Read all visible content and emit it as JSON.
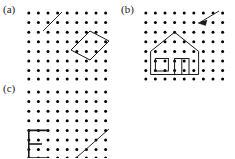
{
  "figure": {
    "background_color": "#ffffff",
    "ink_color": "#1a1a1a",
    "dot_color": "#000000",
    "panel_count": 3
  },
  "panels": [
    {
      "id": "a",
      "label": "(a)",
      "grid": {
        "cols": 9,
        "rows": 8,
        "spacing": 9.6,
        "dot_radius": 1.5
      },
      "shapes": [
        {
          "name": "diagonal-segment",
          "type": "line",
          "points": "39,3 20,22",
          "description": "short diagonal stroke in upper left area"
        },
        {
          "name": "rotated-rectangle",
          "type": "polygon",
          "points": "48,40 67,21 86,31 67,50",
          "description": "tilted rectangle outline right of center"
        }
      ]
    },
    {
      "id": "b",
      "label": "(b)",
      "grid": {
        "cols": 9,
        "rows": 8,
        "spacing": 9.6,
        "dot_radius": 1.5
      },
      "shapes": [
        {
          "name": "house-outline",
          "type": "polygon",
          "points": "9.6,38.4 9.6,67.2 57.6,67.2 57.6,38.4 33.6,19.2",
          "description": "house body with pitched roof"
        },
        {
          "name": "house-window",
          "type": "rect",
          "points": "14.4,48 28.8,48 28.8,62.4 14.4,62.4",
          "description": "small square window on the left of the house"
        },
        {
          "name": "house-door",
          "type": "rect",
          "points": "33.6,48 48,48 48,67.2 33.6,67.2",
          "description": "door rectangle right of the window"
        },
        {
          "name": "door-mullion",
          "type": "line",
          "points": "40.8,48 40.8,67.2",
          "description": "vertical divider inside the door"
        },
        {
          "name": "arrow-cursor",
          "type": "arrow",
          "points": "76.8,0 57.6,14.4",
          "description": "arrow pointing down-left in the upper right"
        }
      ]
    },
    {
      "id": "c",
      "label": "(c)",
      "grid": {
        "cols": 9,
        "rows": 8,
        "spacing": 9.6,
        "dot_radius": 1.5
      },
      "shapes": [
        {
          "name": "bracket-e-shape",
          "type": "polyline",
          "points": "24,38.4 4.8,38.4 4.8,67.2 24,67.2",
          "description": "open bracket forming an E-like figure"
        },
        {
          "name": "bracket-middle-bar",
          "type": "line",
          "points": "4.8,52.8 19.2,52.8",
          "description": "middle horizontal bar of the E"
        },
        {
          "name": "diagonal-segment",
          "type": "line",
          "points": "52.8,67.2 86.4,38.4",
          "description": "long diagonal stroke toward the lower right"
        }
      ]
    }
  ]
}
